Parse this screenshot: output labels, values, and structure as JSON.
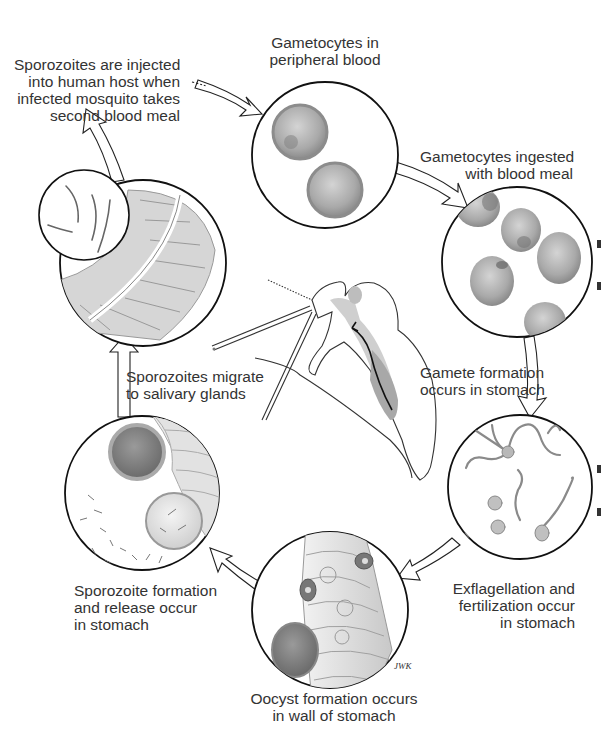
{
  "colors": {
    "outline": "#111111",
    "text": "#333333",
    "cell_fill": "#b9b9b9",
    "cell_dark": "#8d8d8d",
    "tissue_fill": "#d9d9d9",
    "background": "#ffffff"
  },
  "stages": [
    {
      "id": "gametocytes-peripheral-blood",
      "lines": [
        "Gametocytes in",
        "peripheral blood"
      ],
      "illustration": "two-gametocyte-cells"
    },
    {
      "id": "gametocytes-ingested",
      "lines": [
        "Gametocytes ingested",
        "with blood meal"
      ],
      "illustration": "five-gametocyte-cells"
    },
    {
      "id": "gamete-formation",
      "lines": [
        "Gamete formation",
        "occurs in stomach"
      ],
      "illustration": "none"
    },
    {
      "id": "exflagellation-fertilization",
      "lines": [
        "Exflagellation and",
        "fertilization occur",
        "in stomach"
      ],
      "illustration": "flagellated-gametes"
    },
    {
      "id": "oocyst-formation",
      "lines": [
        "Oocyst formation occurs",
        "in wall of stomach"
      ],
      "illustration": "stomach-wall-with-oocyst"
    },
    {
      "id": "sporozoite-formation",
      "lines": [
        "Sporozoite formation",
        "and release occur",
        "in stomach"
      ],
      "illustration": "rupturing-oocyst"
    },
    {
      "id": "sporozoites-migrate",
      "lines": [
        "Sporozoites migrate",
        "to salivary glands"
      ],
      "illustration": "mosquito-cross-section"
    },
    {
      "id": "sporozoites-injected",
      "lines": [
        "Sporozoites are injected",
        "into human host when",
        "infected mosquito takes",
        "second blood meal"
      ],
      "illustration": "salivary-gland-with-sporozoites"
    }
  ],
  "signature": "JWK"
}
